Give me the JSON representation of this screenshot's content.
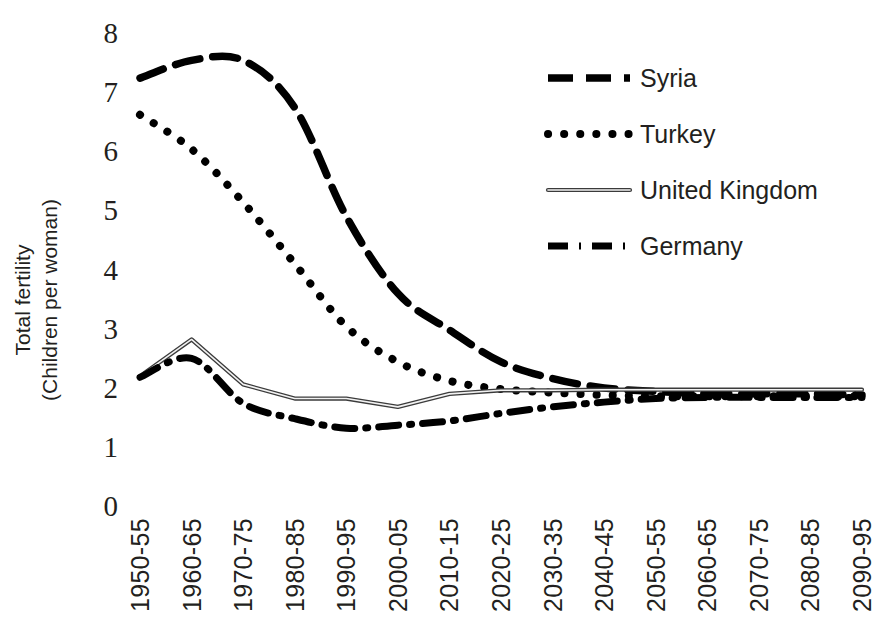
{
  "chart_data": {
    "type": "line",
    "title": "",
    "xlabel": "",
    "ylabel": "Total fertility\n(Children per woman)",
    "ylabel_line1": "Total fertility",
    "ylabel_line2": "(Children per woman)",
    "ylim": [
      0,
      8
    ],
    "y_ticks": [
      0,
      1,
      2,
      3,
      4,
      5,
      6,
      7,
      8
    ],
    "y_tick_labels": [
      "0",
      "1",
      "2",
      "3",
      "4",
      "5",
      "6",
      "7",
      "8"
    ],
    "grid": false,
    "legend_position": "top-right",
    "categories": [
      "1950-55",
      "1960-65",
      "1970-75",
      "1980-85",
      "1990-95",
      "2000-05",
      "2010-15",
      "2020-25",
      "2030-35",
      "2040-45",
      "2050-55",
      "2060-65",
      "2070-75",
      "2080-85",
      "2090-95"
    ],
    "x_tick_labels": [
      "1950-55",
      "1960-65",
      "1970-75",
      "1980-85",
      "1990-95",
      "2000-05",
      "2010-15",
      "2020-25",
      "2030-35",
      "2040-45",
      "2050-55",
      "2060-65",
      "2070-75",
      "2080-85",
      "2090-95"
    ],
    "series": [
      {
        "name": "Syria",
        "style": "dashed",
        "color": "#000000",
        "values": [
          7.22,
          7.52,
          7.52,
          6.72,
          4.88,
          3.58,
          2.96,
          2.42,
          2.14,
          1.98,
          1.92,
          1.88,
          1.88,
          1.88,
          1.86
        ]
      },
      {
        "name": "Turkey",
        "style": "dotted",
        "color": "#000000",
        "values": [
          6.6,
          6.02,
          5.12,
          4.08,
          3.02,
          2.42,
          2.1,
          1.96,
          1.9,
          1.86,
          1.84,
          1.84,
          1.84,
          1.84,
          1.84
        ]
      },
      {
        "name": "United Kingdom",
        "style": "solid",
        "color": "#3b3b3b",
        "values": [
          2.18,
          2.8,
          2.04,
          1.8,
          1.8,
          1.66,
          1.88,
          1.94,
          1.94,
          1.95,
          1.95,
          1.95,
          1.95,
          1.95,
          1.95
        ]
      },
      {
        "name": "Germany",
        "style": "dash-dot",
        "color": "#000000",
        "values": [
          2.16,
          2.48,
          1.72,
          1.46,
          1.3,
          1.35,
          1.42,
          1.55,
          1.66,
          1.74,
          1.8,
          1.82,
          1.82,
          1.82,
          1.82
        ]
      }
    ]
  },
  "legend": {
    "items": [
      {
        "label": "Syria",
        "style": "dashed"
      },
      {
        "label": "Turkey",
        "style": "dotted"
      },
      {
        "label": "United Kingdom",
        "style": "solid"
      },
      {
        "label": "Germany",
        "style": "dash-dot"
      }
    ]
  }
}
